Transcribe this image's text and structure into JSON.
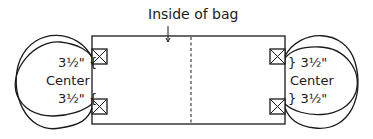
{
  "diagram": {
    "title_label": "Inside of bag",
    "left": {
      "top_measure": "3½\" {",
      "center_label": "Center",
      "bottom_measure": "3½\" {"
    },
    "right": {
      "top_measure": "} 3½\"",
      "center_label": "Center",
      "bottom_measure": "} 3½\""
    },
    "elements": {
      "bag_rectangle": "bag-outline",
      "fold_line": "dashed-center-fold",
      "handles": [
        "left-handle-outer",
        "left-handle-inner",
        "right-handle-outer",
        "right-handle-inner"
      ],
      "attachment_boxes": [
        "left-top-x-box",
        "left-bottom-x-box",
        "right-top-x-box",
        "right-bottom-x-box"
      ]
    },
    "colors": {
      "line": "#1a1a1a",
      "background": "#ffffff"
    }
  }
}
